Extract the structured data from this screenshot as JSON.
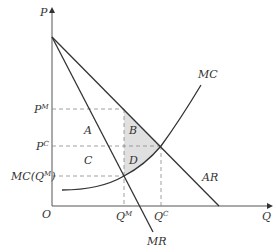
{
  "diagram": {
    "axes": {
      "y_label": "P",
      "x_label": "Q",
      "origin_label": "O"
    },
    "curves": [
      {
        "name": "MC",
        "label": "MC"
      },
      {
        "name": "AR",
        "label": "AR"
      },
      {
        "name": "MR",
        "label": "MR"
      }
    ],
    "price_levels": [
      {
        "label": "P",
        "sup": "M"
      },
      {
        "label": "P",
        "sup": "C"
      },
      {
        "label": "MC(Q",
        "sup": "M",
        "suffix": ")"
      }
    ],
    "quantity_levels": [
      {
        "label": "Q",
        "sup": "M"
      },
      {
        "label": "Q",
        "sup": "C"
      }
    ],
    "regions": [
      "A",
      "B",
      "C",
      "D"
    ],
    "shaded_regions": [
      "B",
      "D"
    ],
    "colors": {
      "line": "#333333",
      "dash": "#888888",
      "shade": "#e0e0e0"
    }
  }
}
